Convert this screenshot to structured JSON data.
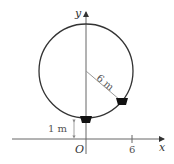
{
  "diagram": {
    "axis_x_label": "x",
    "axis_y_label": "y",
    "origin_label": "O",
    "x_tick_label": "6",
    "radius_label": "6 m",
    "height_label": "1 m",
    "colors": {
      "circle": "#333333",
      "axis": "#666666",
      "radius_line": "#888888",
      "car": "#111111"
    }
  }
}
